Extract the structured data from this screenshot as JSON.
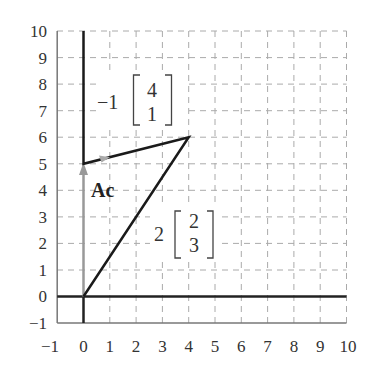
{
  "figure": {
    "x_ticks": [
      "−1",
      "0",
      "1",
      "2",
      "3",
      "4",
      "5",
      "6",
      "7",
      "8",
      "9",
      "10"
    ],
    "y_ticks": [
      "10",
      "9",
      "8",
      "7",
      "6",
      "5",
      "4",
      "3",
      "2",
      "1",
      "0",
      "−1"
    ],
    "x_range": [
      -1,
      10
    ],
    "y_range": [
      -1,
      10
    ],
    "grid": "dashed",
    "labels": {
      "ac": "Ac",
      "term1": {
        "coef": "−1",
        "vec_top": "4",
        "vec_bottom": "1"
      },
      "term2": {
        "coef": "2",
        "vec_top": "2",
        "vec_bottom": "3"
      }
    },
    "paths": {
      "black_path": [
        [
          0,
          10
        ],
        [
          0,
          5
        ],
        [
          4,
          6
        ],
        [
          0,
          0
        ]
      ],
      "gray_arrow": {
        "from": [
          0,
          0
        ],
        "to": [
          0,
          5
        ]
      }
    },
    "colors": {
      "axis": "#222222",
      "grid": "#aaaaaa",
      "gray_arrow": "#999999",
      "frame": "#777777"
    }
  }
}
